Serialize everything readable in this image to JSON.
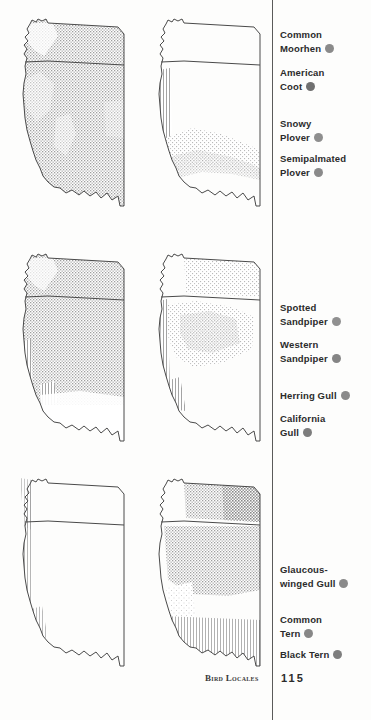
{
  "footer": {
    "section_title": "Bird Locales",
    "page_number": "115"
  },
  "legend": {
    "items": [
      {
        "line1": "Common",
        "line2": "Moorhen",
        "dot_color": "#8a8a8a",
        "top": 28
      },
      {
        "line1": "American",
        "line2": "Coot",
        "dot_color": "#707070",
        "top": 66
      },
      {
        "line1": "Snowy",
        "line2": "Plover",
        "dot_color": "#8e8e8e",
        "top": 117
      },
      {
        "line1": "Semipalmated",
        "line2": "Plover",
        "dot_color": "#8a8a8a",
        "top": 152
      },
      {
        "line1": "Spotted",
        "line2": "Sandpiper",
        "dot_color": "#909090",
        "top": 301
      },
      {
        "line1": "Western",
        "line2": "Sandpiper",
        "dot_color": "#858585",
        "top": 338
      },
      {
        "line1": "Herring Gull",
        "line2": "",
        "dot_color": "#8a8a8a",
        "top": 389
      },
      {
        "line1": "California",
        "line2": "Gull",
        "dot_color": "#7d7d7d",
        "top": 412
      },
      {
        "line1": "Glaucous-",
        "line2": "winged Gull",
        "dot_color": "#8a8a8a",
        "top": 563
      },
      {
        "line1": "Common",
        "line2": "Tern",
        "dot_color": "#878787",
        "top": 613
      },
      {
        "line1": "Black Tern",
        "line2": "",
        "dot_color": "#7e7e7e",
        "top": 648
      }
    ]
  },
  "maps": {
    "items": [
      {
        "id": "map-1",
        "left": 0,
        "top": 10,
        "shading": "near-full-range",
        "density": "medium"
      },
      {
        "id": "map-2",
        "left": 136,
        "top": 10,
        "shading": "coastal-and-southwest",
        "density": "light"
      },
      {
        "id": "map-3",
        "left": 0,
        "top": 245,
        "shading": "northern-and-interior",
        "density": "medium"
      },
      {
        "id": "map-4",
        "left": 136,
        "top": 245,
        "shading": "interior-basin",
        "density": "light"
      },
      {
        "id": "map-5",
        "left": 0,
        "top": 470,
        "shading": "narrow-coastal-strip",
        "density": "very-light"
      },
      {
        "id": "map-6",
        "left": 136,
        "top": 470,
        "shading": "northern-heavy",
        "density": "heavy"
      }
    ]
  }
}
